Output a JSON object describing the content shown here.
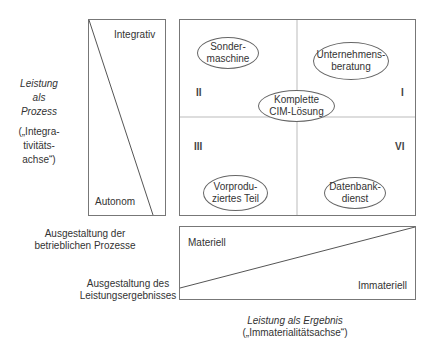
{
  "left_axis": {
    "title_lines": [
      "Leistung",
      "als",
      "Prozess"
    ],
    "subtitle_lines": [
      "(„Integra-",
      "tivitäts-",
      "achse“)"
    ],
    "top_label": "Integrativ",
    "bottom_label": "Autonom"
  },
  "matrix": {
    "quadrants": [
      {
        "id": "II",
        "label": "II"
      },
      {
        "id": "I",
        "label": "I"
      },
      {
        "id": "III",
        "label": "III"
      },
      {
        "id": "VI",
        "label": "VI"
      }
    ],
    "ellipses": [
      {
        "lines": [
          "Sonder-",
          "maschine"
        ]
      },
      {
        "lines": [
          "Unternehmens-",
          "beratung"
        ]
      },
      {
        "lines": [
          "Komplette",
          "CIM-Lösung"
        ]
      },
      {
        "lines": [
          "Vorprodu-",
          "ziertes Teil"
        ]
      },
      {
        "lines": [
          "Datenbank-",
          "dienst"
        ]
      }
    ]
  },
  "bottom_axis": {
    "top_label": "Materiell",
    "bottom_label": "Immateriell",
    "left_label_1_lines": [
      "Ausgestaltung der",
      "betrieblichen Prozesse"
    ],
    "left_label_2_lines": [
      "Ausgestaltung des",
      "Leistungsergebnisses"
    ],
    "title": "Leistung als Ergebnis",
    "subtitle": "(„Immaterialitätsachse“)"
  }
}
